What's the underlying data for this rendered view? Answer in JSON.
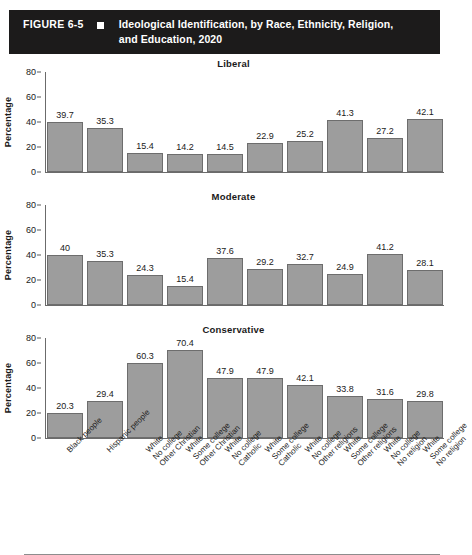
{
  "header": {
    "figure_number": "FIGURE 6-5",
    "bullet_icon": "square-bullet-icon",
    "title": "Ideological Identification, by Race, Ethnicity, Religion, and Education, 2020",
    "title_line1": "Ideological Identification, by Race, Ethnicity, Religion,",
    "title_line2": "and Education, 2020",
    "background_color": "#1c1b1b",
    "text_color": "#ffffff"
  },
  "chart_data": {
    "type": "bar",
    "title": "Ideological Identification, by Race, Ethnicity, Religion, and Education, 2020",
    "xlabel": "",
    "ylabel": "Percentage",
    "ylim": [
      0,
      80
    ],
    "yticks": [
      0,
      20,
      40,
      60,
      80
    ],
    "grid": false,
    "legend": "none",
    "bar_color": "#9d9d9d",
    "bar_edge_color": "#6d6d6d",
    "categories": [
      "Black people",
      "Hispanic people",
      "White No college Other Christian",
      "White Some college Other Christian",
      "White No college Catholic",
      "White Some college Catholic",
      "White No college Other religions",
      "White Some college Other religions",
      "White No college No religion",
      "White Some college No religion"
    ],
    "category_lines": [
      [
        "Black people"
      ],
      [
        "Hispanic people"
      ],
      [
        "White",
        "No college",
        "Other Christian"
      ],
      [
        "White",
        "Some college",
        "Other Christian"
      ],
      [
        "White",
        "No college",
        "Catholic"
      ],
      [
        "White",
        "Some college",
        "Catholic"
      ],
      [
        "White",
        "No college",
        "Other religions"
      ],
      [
        "White",
        "Some college",
        "Other religions"
      ],
      [
        "White",
        "No college",
        "No religion"
      ],
      [
        "White",
        "Some college",
        "No religion"
      ]
    ],
    "panels": [
      {
        "title": "Liberal",
        "values": [
          39.7,
          35.3,
          15.4,
          14.2,
          14.5,
          22.9,
          25.2,
          41.3,
          27.2,
          42.1
        ],
        "labels": [
          "39.7",
          "35.3",
          "15.4",
          "14.2",
          "14.5",
          "22.9",
          "25.2",
          "41.3",
          "27.2",
          "42.1"
        ]
      },
      {
        "title": "Moderate",
        "values": [
          40,
          35.3,
          24.3,
          15.4,
          37.6,
          29.2,
          32.7,
          24.9,
          41.2,
          28.1
        ],
        "labels": [
          "40",
          "35.3",
          "24.3",
          "15.4",
          "37.6",
          "29.2",
          "32.7",
          "24.9",
          "41.2",
          "28.1"
        ]
      },
      {
        "title": "Conservative",
        "values": [
          20.3,
          29.4,
          60.3,
          70.4,
          47.9,
          47.9,
          42.1,
          33.8,
          31.6,
          29.8
        ],
        "labels": [
          "20.3",
          "29.4",
          "60.3",
          "70.4",
          "47.9",
          "47.9",
          "42.1",
          "33.8",
          "31.6",
          "29.8"
        ]
      }
    ],
    "series": [
      {
        "name": "Liberal",
        "values": [
          39.7,
          35.3,
          15.4,
          14.2,
          14.5,
          22.9,
          25.2,
          41.3,
          27.2,
          42.1
        ]
      },
      {
        "name": "Moderate",
        "values": [
          40,
          35.3,
          24.3,
          15.4,
          37.6,
          29.2,
          32.7,
          24.9,
          41.2,
          28.1
        ]
      },
      {
        "name": "Conservative",
        "values": [
          20.3,
          29.4,
          60.3,
          70.4,
          47.9,
          47.9,
          42.1,
          33.8,
          31.6,
          29.8
        ]
      }
    ]
  }
}
